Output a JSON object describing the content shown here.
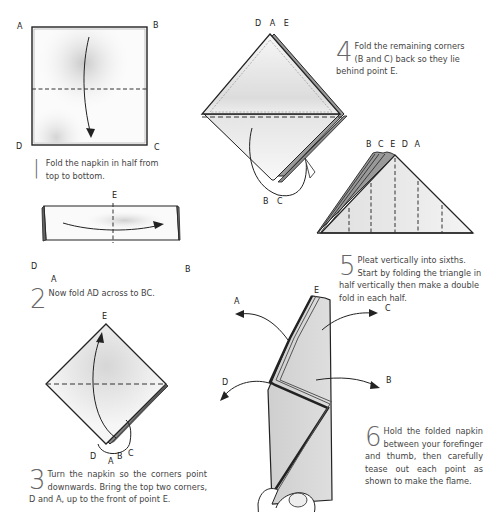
{
  "steps": [
    {
      "number": "1",
      "marker": "|",
      "text": "Fold the napkin in half from top to bottom.",
      "labels": {
        "top_left": "A",
        "top_right": "B",
        "bottom_left": "D",
        "bottom_right": "C"
      }
    },
    {
      "number": "2",
      "text": "Now fold AD across to BC.",
      "labels": {
        "top_center": "E",
        "left": "D",
        "bottom_left": "A",
        "right": "B"
      }
    },
    {
      "number": "3",
      "text": "Turn the napkin so the corners point downwards. Bring the top two corners, D and A, up to the front of point E.",
      "labels": {
        "top": "E",
        "bottom_left": "D",
        "bottom_a": "A",
        "bottom_b": "B",
        "bottom_c": "C"
      }
    },
    {
      "number": "4",
      "text": "Fold the remaining corners (B and C) back so they lie behind point E.",
      "labels": {
        "top": "D A E",
        "bottom_b": "B",
        "bottom_c": "C"
      }
    },
    {
      "number": "5",
      "text": "Pleat vertically into sixths. Start by folding the triangle in half vertically then make a double fold in each half.",
      "labels": {
        "top": "B C E D A"
      }
    },
    {
      "number": "6",
      "text": "Hold the folded napkin between your forefinger and thumb, then carefully tease out each point as shown to make the flame.",
      "labels": {
        "top": "E",
        "arrow_a": "A",
        "arrow_c": "C",
        "arrow_b": "B",
        "arrow_d": "D"
      }
    }
  ],
  "colors": {
    "ink": "#222222",
    "paper_shade": "#d8d8d8",
    "paper_light": "#f2f2f2",
    "caption": "#444444",
    "step_number": "#666666"
  }
}
